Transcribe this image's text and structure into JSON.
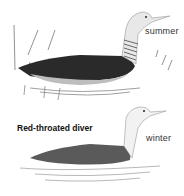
{
  "illustration": {
    "title": "Red-throated diver",
    "plumages": [
      {
        "label": "summer"
      },
      {
        "label": "winter"
      }
    ]
  }
}
